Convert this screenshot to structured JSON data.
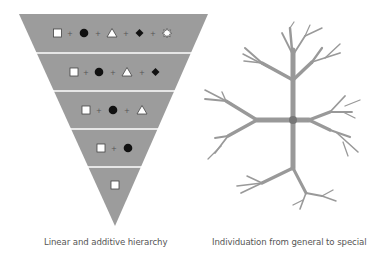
{
  "colors": {
    "fill": "#9c9c9c",
    "separator": "#ffffff",
    "branch": "#999999",
    "node": "#777777",
    "text": "#555555"
  },
  "left_diagram": {
    "caption": "Linear and additive hierarchy",
    "shape": "inverted-triangle",
    "levels": [
      {
        "level": 1,
        "symbols": [
          "square",
          "circle",
          "triangle",
          "diamond",
          "star"
        ],
        "separator": "+"
      },
      {
        "level": 2,
        "symbols": [
          "square",
          "circle",
          "triangle",
          "diamond"
        ],
        "separator": "+"
      },
      {
        "level": 3,
        "symbols": [
          "square",
          "circle",
          "triangle"
        ],
        "separator": "+"
      },
      {
        "level": 4,
        "symbols": [
          "square",
          "circle"
        ],
        "separator": "+"
      },
      {
        "level": 5,
        "symbols": [
          "square"
        ],
        "separator": "+"
      }
    ],
    "plus": "+"
  },
  "right_diagram": {
    "caption": "Individuation from general to special",
    "shape": "branching-tree"
  }
}
